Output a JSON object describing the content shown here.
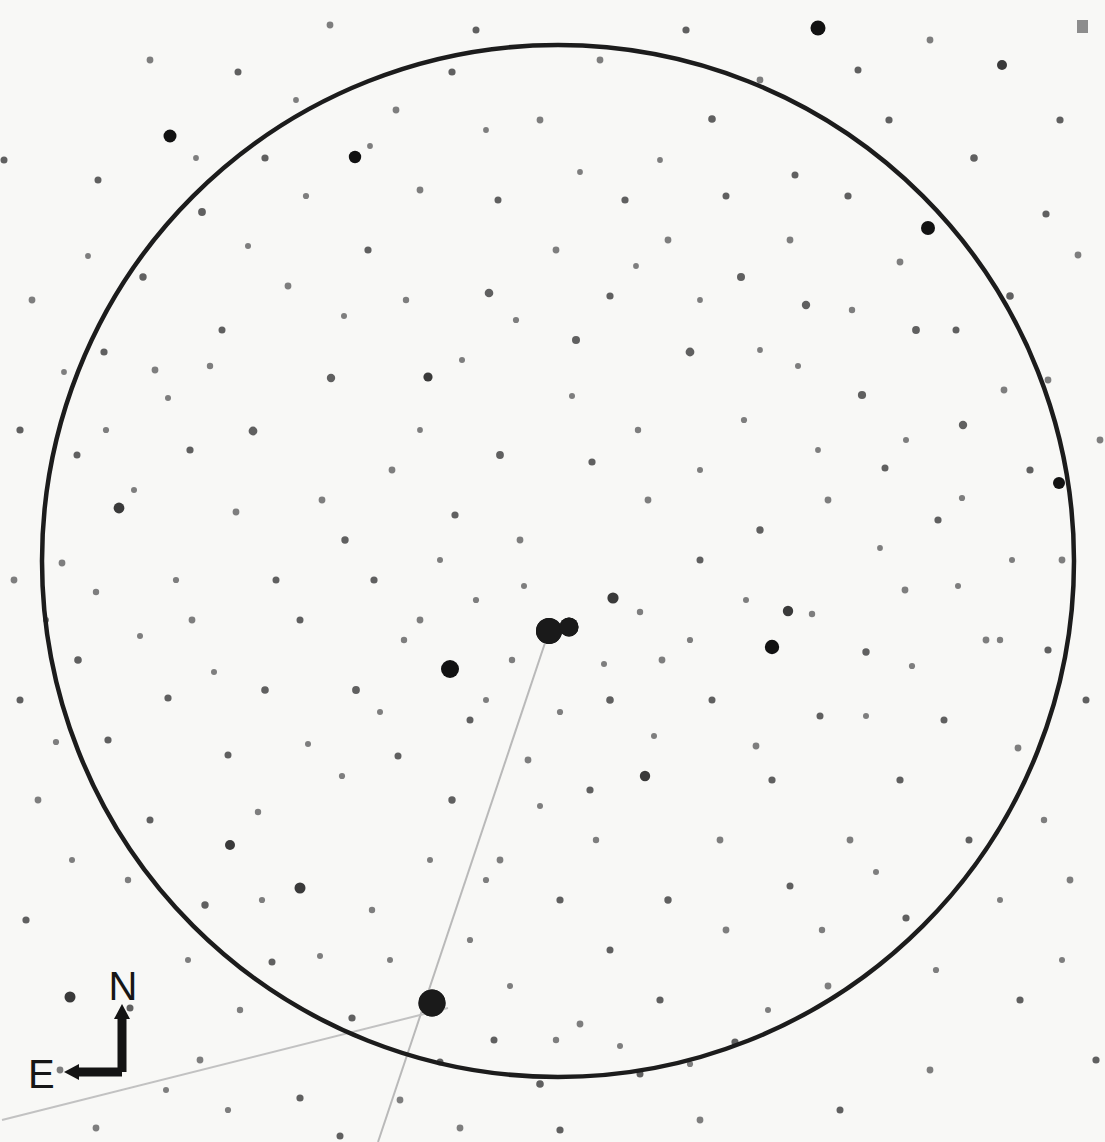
{
  "meta": {
    "kind": "astronomical-finder-chart",
    "width": 1105,
    "height": 1142,
    "background_color": "#f8f8f6",
    "ink_color": "#1a1a1a"
  },
  "field_circle": {
    "label": "field-of-view-circle",
    "cx": 558,
    "cy": 561,
    "r": 516,
    "stroke": "#1c1c1c",
    "stroke_width": 4.5
  },
  "compass": {
    "north_label": "N",
    "east_label": "E",
    "north_label_x": 123,
    "north_label_y": 1000,
    "east_label_x": 28,
    "east_label_y": 1088,
    "origin_x": 122,
    "origin_y": 1072,
    "north_tip_x": 122,
    "north_tip_y": 1004,
    "east_tip_x": 64,
    "east_tip_y": 1072,
    "stroke": "#141414",
    "stroke_width": 9
  },
  "corner_mark": {
    "label": "scale-tick-mark",
    "x": 1077,
    "y": 20,
    "w": 11,
    "h": 13,
    "color": "#8d8d8d"
  },
  "pointer_lines": [
    {
      "name": "primary-target-pointer",
      "x1": 549,
      "y1": 631,
      "x2": 378,
      "y2": 1142,
      "stroke": "#b9b9b9",
      "stroke_width": 2.0
    },
    {
      "name": "secondary-target-pointer",
      "x1": 448,
      "y1": 1008,
      "x2": 2,
      "y2": 1120,
      "stroke": "#c2c2c2",
      "stroke_width": 2.0
    }
  ],
  "marked_objects": [
    {
      "name": "primary-target-star",
      "x": 432,
      "y": 1003,
      "r": 13.5
    },
    {
      "name": "comparison-star-a",
      "x": 549,
      "y": 631,
      "r": 13.0
    },
    {
      "name": "comparison-star-b",
      "x": 569,
      "y": 627,
      "r": 9.5
    }
  ],
  "chart_data": {
    "type": "scatter",
    "title": "",
    "xlabel": "",
    "ylabel": "",
    "xlim": [
      0,
      1105
    ],
    "ylim": [
      0,
      1142
    ],
    "grid": false,
    "legend": null,
    "note": "Star positions in pixel coordinates; r encodes apparent magnitude (larger = brighter).",
    "stars": [
      [
        549,
        631,
        13.0
      ],
      [
        569,
        627,
        9.5
      ],
      [
        432,
        1003,
        13.5
      ],
      [
        450,
        669,
        9.0
      ],
      [
        772,
        647,
        7.2
      ],
      [
        788,
        611,
        5.2
      ],
      [
        928,
        228,
        7.0
      ],
      [
        170,
        136,
        6.5
      ],
      [
        355,
        157,
        6.2
      ],
      [
        818,
        28,
        7.5
      ],
      [
        1002,
        65,
        5.0
      ],
      [
        1059,
        483,
        6.0
      ],
      [
        70,
        997,
        5.5
      ],
      [
        613,
        598,
        5.6
      ],
      [
        645,
        776,
        5.2
      ],
      [
        300,
        888,
        5.5
      ],
      [
        230,
        845,
        5.0
      ],
      [
        119,
        508,
        5.4
      ],
      [
        253,
        431,
        4.4
      ],
      [
        331,
        378,
        4.2
      ],
      [
        428,
        377,
        4.6
      ],
      [
        489,
        293,
        4.3
      ],
      [
        576,
        340,
        4.0
      ],
      [
        690,
        352,
        4.4
      ],
      [
        741,
        277,
        4.0
      ],
      [
        806,
        305,
        4.2
      ],
      [
        862,
        395,
        4.1
      ],
      [
        916,
        330,
        3.9
      ],
      [
        963,
        425,
        4.2
      ],
      [
        1010,
        296,
        3.8
      ],
      [
        1046,
        214,
        3.6
      ],
      [
        974,
        158,
        3.8
      ],
      [
        889,
        120,
        3.6
      ],
      [
        795,
        175,
        3.5
      ],
      [
        712,
        119,
        3.8
      ],
      [
        625,
        200,
        3.6
      ],
      [
        540,
        120,
        3.4
      ],
      [
        452,
        72,
        3.6
      ],
      [
        330,
        25,
        3.4
      ],
      [
        238,
        72,
        3.5
      ],
      [
        202,
        212,
        3.9
      ],
      [
        143,
        277,
        3.7
      ],
      [
        104,
        352,
        3.6
      ],
      [
        77,
        455,
        3.5
      ],
      [
        62,
        563,
        3.4
      ],
      [
        78,
        660,
        3.8
      ],
      [
        108,
        740,
        3.6
      ],
      [
        150,
        820,
        3.5
      ],
      [
        205,
        905,
        3.7
      ],
      [
        272,
        962,
        3.5
      ],
      [
        352,
        1018,
        3.6
      ],
      [
        440,
        1062,
        3.5
      ],
      [
        540,
        1084,
        3.8
      ],
      [
        640,
        1074,
        3.5
      ],
      [
        735,
        1042,
        3.6
      ],
      [
        828,
        986,
        3.4
      ],
      [
        906,
        918,
        3.6
      ],
      [
        969,
        840,
        3.5
      ],
      [
        1018,
        748,
        3.4
      ],
      [
        1048,
        650,
        3.6
      ],
      [
        1062,
        560,
        3.4
      ],
      [
        500,
        455,
        3.9
      ],
      [
        455,
        515,
        3.6
      ],
      [
        392,
        470,
        3.4
      ],
      [
        345,
        540,
        3.7
      ],
      [
        300,
        620,
        3.5
      ],
      [
        265,
        690,
        3.8
      ],
      [
        228,
        755,
        3.5
      ],
      [
        192,
        620,
        3.4
      ],
      [
        168,
        698,
        3.6
      ],
      [
        356,
        690,
        3.9
      ],
      [
        398,
        756,
        3.5
      ],
      [
        452,
        800,
        3.7
      ],
      [
        500,
        860,
        3.4
      ],
      [
        560,
        900,
        3.6
      ],
      [
        610,
        950,
        3.5
      ],
      [
        668,
        900,
        3.7
      ],
      [
        720,
        840,
        3.4
      ],
      [
        772,
        780,
        3.6
      ],
      [
        820,
        716,
        3.5
      ],
      [
        866,
        652,
        3.7
      ],
      [
        905,
        590,
        3.4
      ],
      [
        938,
        520,
        3.6
      ],
      [
        885,
        468,
        3.5
      ],
      [
        828,
        500,
        3.4
      ],
      [
        760,
        530,
        3.7
      ],
      [
        700,
        560,
        3.5
      ],
      [
        648,
        500,
        3.4
      ],
      [
        592,
        462,
        3.6
      ],
      [
        520,
        540,
        3.4
      ],
      [
        610,
        700,
        3.8
      ],
      [
        662,
        660,
        3.4
      ],
      [
        712,
        700,
        3.5
      ],
      [
        756,
        746,
        3.4
      ],
      [
        590,
        790,
        3.6
      ],
      [
        528,
        760,
        3.4
      ],
      [
        470,
        720,
        3.5
      ],
      [
        420,
        620,
        3.4
      ],
      [
        374,
        580,
        3.6
      ],
      [
        322,
        500,
        3.4
      ],
      [
        276,
        580,
        3.5
      ],
      [
        236,
        512,
        3.4
      ],
      [
        190,
        450,
        3.6
      ],
      [
        155,
        370,
        3.4
      ],
      [
        222,
        330,
        3.5
      ],
      [
        288,
        286,
        3.4
      ],
      [
        368,
        250,
        3.6
      ],
      [
        420,
        190,
        3.4
      ],
      [
        498,
        200,
        3.5
      ],
      [
        556,
        250,
        3.4
      ],
      [
        610,
        296,
        3.6
      ],
      [
        668,
        240,
        3.4
      ],
      [
        726,
        196,
        3.5
      ],
      [
        790,
        240,
        3.4
      ],
      [
        848,
        196,
        3.6
      ],
      [
        900,
        262,
        3.4
      ],
      [
        956,
        330,
        3.5
      ],
      [
        1004,
        390,
        3.4
      ],
      [
        1030,
        470,
        3.6
      ],
      [
        1048,
        380,
        3.4
      ],
      [
        944,
        720,
        3.5
      ],
      [
        986,
        640,
        3.4
      ],
      [
        900,
        780,
        3.6
      ],
      [
        850,
        840,
        3.4
      ],
      [
        790,
        886,
        3.5
      ],
      [
        726,
        930,
        3.4
      ],
      [
        660,
        1000,
        3.6
      ],
      [
        580,
        1024,
        3.4
      ],
      [
        494,
        1040,
        3.5
      ],
      [
        400,
        1100,
        3.4
      ],
      [
        300,
        1098,
        3.6
      ],
      [
        200,
        1060,
        3.4
      ],
      [
        130,
        1008,
        3.5
      ],
      [
        60,
        1070,
        3.4
      ],
      [
        26,
        920,
        3.6
      ],
      [
        38,
        800,
        3.4
      ],
      [
        20,
        700,
        3.5
      ],
      [
        14,
        580,
        3.4
      ],
      [
        20,
        430,
        3.6
      ],
      [
        32,
        300,
        3.4
      ],
      [
        98,
        180,
        3.5
      ],
      [
        150,
        60,
        3.4
      ],
      [
        265,
        158,
        3.6
      ],
      [
        396,
        110,
        3.4
      ],
      [
        476,
        30,
        3.5
      ],
      [
        600,
        60,
        3.4
      ],
      [
        686,
        30,
        3.6
      ],
      [
        760,
        80,
        3.4
      ],
      [
        858,
        70,
        3.5
      ],
      [
        930,
        40,
        3.4
      ],
      [
        1060,
        120,
        3.6
      ],
      [
        1078,
        255,
        3.4
      ],
      [
        1086,
        700,
        3.5
      ],
      [
        1070,
        880,
        3.4
      ],
      [
        1020,
        1000,
        3.6
      ],
      [
        930,
        1070,
        3.4
      ],
      [
        840,
        1110,
        3.5
      ],
      [
        700,
        1120,
        3.4
      ],
      [
        560,
        1130,
        3.6
      ],
      [
        460,
        1128,
        3.4
      ],
      [
        340,
        1136,
        3.5
      ],
      [
        96,
        1128,
        3.4
      ],
      [
        1096,
        1060,
        3.6
      ],
      [
        1100,
        440,
        3.4
      ],
      [
        4,
        160,
        3.5
      ],
      [
        512,
        660,
        3.2
      ],
      [
        486,
        700,
        3.0
      ],
      [
        560,
        712,
        3.1
      ],
      [
        604,
        664,
        3.0
      ],
      [
        640,
        612,
        3.2
      ],
      [
        524,
        586,
        3.0
      ],
      [
        476,
        600,
        3.1
      ],
      [
        440,
        560,
        3.0
      ],
      [
        404,
        640,
        3.2
      ],
      [
        380,
        712,
        3.0
      ],
      [
        342,
        776,
        3.1
      ],
      [
        308,
        744,
        3.0
      ],
      [
        258,
        812,
        3.2
      ],
      [
        214,
        672,
        3.0
      ],
      [
        176,
        580,
        3.1
      ],
      [
        140,
        636,
        3.0
      ],
      [
        96,
        592,
        3.2
      ],
      [
        134,
        490,
        3.0
      ],
      [
        106,
        430,
        3.1
      ],
      [
        168,
        398,
        3.0
      ],
      [
        210,
        366,
        3.2
      ],
      [
        248,
        246,
        3.0
      ],
      [
        306,
        196,
        3.1
      ],
      [
        344,
        316,
        3.0
      ],
      [
        406,
        300,
        3.2
      ],
      [
        462,
        360,
        3.0
      ],
      [
        516,
        320,
        3.1
      ],
      [
        572,
        396,
        3.0
      ],
      [
        638,
        430,
        3.2
      ],
      [
        700,
        470,
        3.0
      ],
      [
        744,
        420,
        3.1
      ],
      [
        798,
        366,
        3.0
      ],
      [
        852,
        310,
        3.2
      ],
      [
        906,
        440,
        3.0
      ],
      [
        962,
        498,
        3.1
      ],
      [
        1012,
        560,
        3.0
      ],
      [
        1000,
        640,
        3.2
      ],
      [
        958,
        586,
        3.0
      ],
      [
        912,
        666,
        3.1
      ],
      [
        866,
        716,
        3.0
      ],
      [
        812,
        614,
        3.2
      ],
      [
        746,
        600,
        3.0
      ],
      [
        690,
        640,
        3.1
      ],
      [
        654,
        736,
        3.0
      ],
      [
        596,
        840,
        3.2
      ],
      [
        540,
        806,
        3.0
      ],
      [
        486,
        880,
        3.1
      ],
      [
        430,
        860,
        3.0
      ],
      [
        372,
        910,
        3.2
      ],
      [
        320,
        956,
        3.0
      ],
      [
        262,
        900,
        3.1
      ],
      [
        188,
        960,
        3.0
      ],
      [
        128,
        880,
        3.2
      ],
      [
        72,
        860,
        3.0
      ],
      [
        56,
        742,
        3.1
      ],
      [
        46,
        620,
        3.0
      ],
      [
        240,
        1010,
        3.2
      ],
      [
        390,
        960,
        3.0
      ],
      [
        470,
        940,
        3.1
      ],
      [
        510,
        986,
        3.0
      ],
      [
        556,
        1040,
        3.2
      ],
      [
        620,
        1046,
        3.0
      ],
      [
        690,
        1064,
        3.1
      ],
      [
        768,
        1010,
        3.0
      ],
      [
        822,
        930,
        3.2
      ],
      [
        876,
        872,
        3.0
      ],
      [
        936,
        970,
        3.1
      ],
      [
        1000,
        900,
        3.0
      ],
      [
        1044,
        820,
        3.2
      ],
      [
        1062,
        960,
        3.0
      ],
      [
        228,
        1110,
        3.1
      ],
      [
        166,
        1090,
        3.0
      ],
      [
        660,
        160,
        2.9
      ],
      [
        580,
        172,
        2.9
      ],
      [
        486,
        130,
        2.9
      ],
      [
        420,
        430,
        2.9
      ],
      [
        370,
        146,
        2.9
      ],
      [
        296,
        100,
        2.9
      ],
      [
        196,
        158,
        2.9
      ],
      [
        88,
        256,
        2.9
      ],
      [
        64,
        372,
        2.9
      ],
      [
        818,
        450,
        2.9
      ],
      [
        880,
        548,
        2.9
      ],
      [
        760,
        350,
        2.9
      ],
      [
        700,
        300,
        2.9
      ],
      [
        636,
        266,
        2.9
      ]
    ]
  }
}
